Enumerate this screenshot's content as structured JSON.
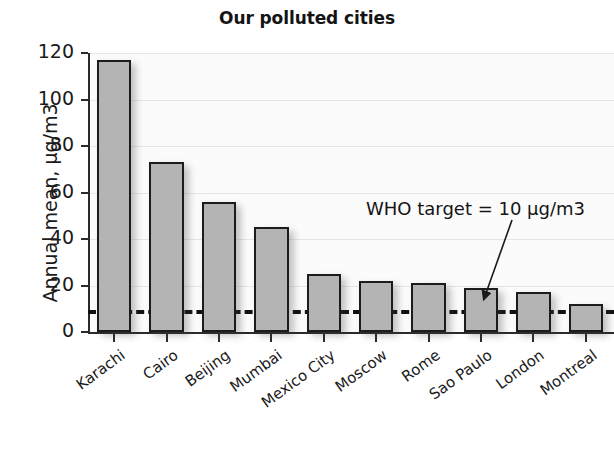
{
  "chart_data": {
    "type": "bar",
    "title": "Our polluted cities",
    "xlabel": "",
    "ylabel": "Annual mean, µg/m3",
    "categories": [
      "Karachi",
      "Cairo",
      "Beijing",
      "Mumbai",
      "Mexico City",
      "Moscow",
      "Rome",
      "Sao Paulo",
      "London",
      "Montreal"
    ],
    "values": [
      117,
      73,
      56,
      45,
      25,
      22,
      21,
      19,
      17,
      12
    ],
    "ylim": [
      0,
      120
    ],
    "yticks": [
      0,
      20,
      40,
      60,
      80,
      100,
      120
    ],
    "ytick_labels": [
      "0",
      "20",
      "40",
      "60",
      "80",
      "100",
      "120"
    ],
    "grid": true,
    "legend": "none",
    "annotations": [
      {
        "text": "WHO target = 10 µg/m3",
        "points_to": "London",
        "value": 10
      }
    ],
    "reference_line": {
      "label": "WHO target",
      "value": 10,
      "style": "dashed"
    },
    "colors": {
      "bar_fill": "#b4b4b4",
      "bar_edge": "#1c1c1c",
      "reference_line": "#121212",
      "grid": "#e6e6e6",
      "plot_background": "#fbfbfb",
      "text": "#1a1a1a"
    }
  }
}
